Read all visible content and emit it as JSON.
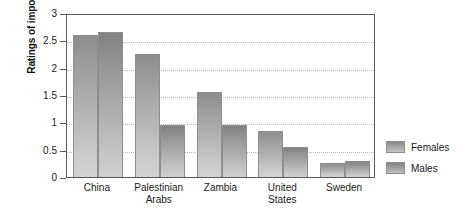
{
  "chart_data": {
    "type": "bar",
    "title": "",
    "xlabel": "",
    "ylabel": "Ratings of importance",
    "ylim": [
      0,
      3
    ],
    "yticks": [
      0,
      0.5,
      1,
      1.5,
      2,
      2.5,
      3
    ],
    "ytick_labels": [
      "0",
      "0.5",
      "1",
      "1.5",
      "2",
      "2.5",
      "3"
    ],
    "grid": true,
    "legend_position": "right",
    "categories": [
      "China",
      "Palestinian Arabs",
      "Zambia",
      "United States",
      "Sweden"
    ],
    "category_lines": [
      [
        "China"
      ],
      [
        "Palestinian",
        "Arabs"
      ],
      [
        "Zambia"
      ],
      [
        "United",
        "States"
      ],
      [
        "Sweden"
      ]
    ],
    "series": [
      {
        "name": "Females",
        "color": "#a5a5a5",
        "values": [
          2.6,
          2.25,
          1.55,
          0.85,
          0.25
        ]
      },
      {
        "name": "Males",
        "color": "#9e9e9e",
        "values": [
          2.65,
          0.95,
          0.95,
          0.55,
          0.29
        ]
      }
    ]
  },
  "legend": {
    "items": [
      {
        "label": "Females"
      },
      {
        "label": "Males"
      }
    ]
  }
}
